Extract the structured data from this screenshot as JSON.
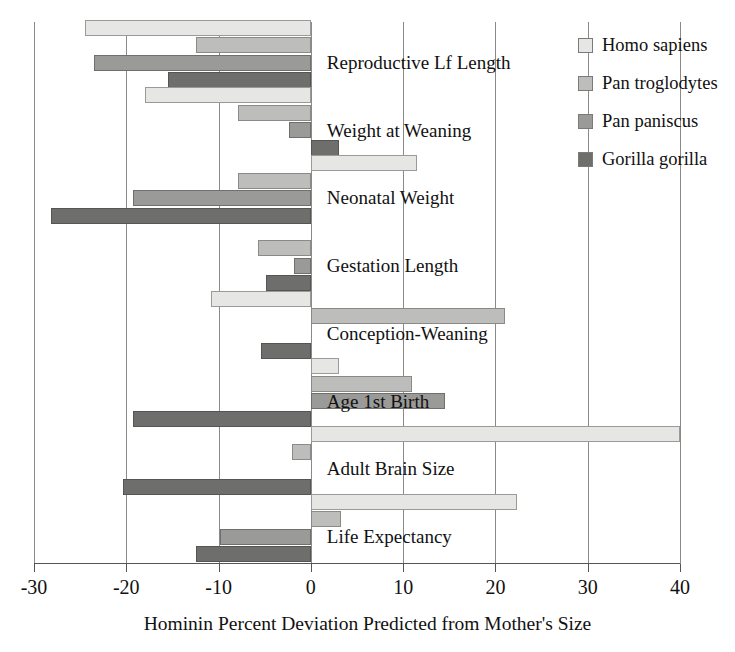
{
  "chart_data": {
    "type": "bar",
    "orientation": "horizontal",
    "title": "",
    "xlabel": "Hominin Percent Deviation Predicted from Mother's Size",
    "ylabel": "",
    "xlim": [
      -30,
      40
    ],
    "xticks": [
      -30,
      -20,
      -10,
      0,
      10,
      20,
      30,
      40
    ],
    "xticklabels": [
      "-30",
      "-20",
      "-10",
      "0",
      "10",
      "20",
      "30",
      "40"
    ],
    "grid": true,
    "grid_axis": "x",
    "legend_position": "upper right",
    "categories": [
      "Reproductive Lf Length",
      "Weight at Weaning",
      "Neonatal Weight",
      "Gestation Length",
      "Conception-Weaning",
      "Age 1st Birth",
      "Adult Brain Size",
      "Life Expectancy"
    ],
    "series": [
      {
        "name": "Homo sapiens",
        "color": "#e6e6e4",
        "values": [
          -24.5,
          -18.0,
          11.5,
          0.0,
          -10.8,
          3.0,
          40.0,
          22.3
        ]
      },
      {
        "name": "Pan troglodytes",
        "color": "#bdbdbb",
        "values": [
          -12.5,
          -7.9,
          -7.9,
          -5.7,
          21.0,
          11.0,
          -2.0,
          3.3
        ]
      },
      {
        "name": "Pan paniscus",
        "color": "#9a9a98",
        "values": [
          -23.5,
          -2.4,
          -19.3,
          -1.8,
          0.0,
          14.5,
          0.0,
          -9.8
        ]
      },
      {
        "name": "Gorilla gorilla",
        "color": "#6e6e6c",
        "values": [
          -15.5,
          3.0,
          -28.2,
          -4.9,
          -5.4,
          -19.3,
          -20.4,
          -12.5
        ]
      }
    ]
  },
  "legend": {
    "items": [
      {
        "label": "Homo sapiens"
      },
      {
        "label": "Pan troglodytes"
      },
      {
        "label": "Pan paniscus"
      },
      {
        "label": "Gorilla gorilla"
      }
    ]
  }
}
